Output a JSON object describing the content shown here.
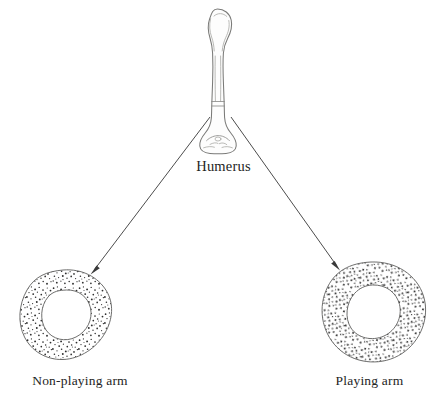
{
  "figure": {
    "background_color": "#ffffff",
    "ink_color": "#242424",
    "width": 447,
    "height": 411
  },
  "labels": {
    "humerus": "Humerus",
    "non_playing_arm": "Non-playing arm",
    "playing_arm": "Playing arm"
  },
  "bone": {
    "name": "humerus-bone-illustration",
    "description": "Anterior view line drawing of a right humerus, proximal head at top and distal condyles at bottom",
    "outline_color": "#7a7a78",
    "section_marker_level_y": 104
  },
  "arrows": [
    {
      "name": "arrow-to-non-playing-arm",
      "from": [
        210,
        117
      ],
      "to": [
        92,
        272
      ],
      "points_at": "Non-playing arm",
      "color": "#4c4c4c"
    },
    {
      "name": "arrow-to-playing-arm",
      "from": [
        231,
        117
      ],
      "to": [
        338,
        268
      ],
      "points_at": "Playing arm",
      "color": "#3a3a3a"
    }
  ],
  "cross_sections": [
    {
      "name": "cross-section-non-playing-arm",
      "label": "Non-playing arm",
      "shape": "rounded-square ring",
      "center": [
        67,
        315
      ],
      "outer_width": 90,
      "outer_height": 90,
      "inner_width": 46,
      "inner_height": 46,
      "cortex_thickness": "thin",
      "fill_pattern": "stipple",
      "relative_bone_mass": "lower"
    },
    {
      "name": "cross-section-playing-arm",
      "label": "Playing arm",
      "shape": "circular ring",
      "center": [
        368,
        312
      ],
      "outer_width": 113,
      "outer_height": 100,
      "inner_width": 50,
      "inner_height": 50,
      "cortex_thickness": "thick",
      "fill_pattern": "stipple",
      "relative_bone_mass": "higher"
    }
  ]
}
